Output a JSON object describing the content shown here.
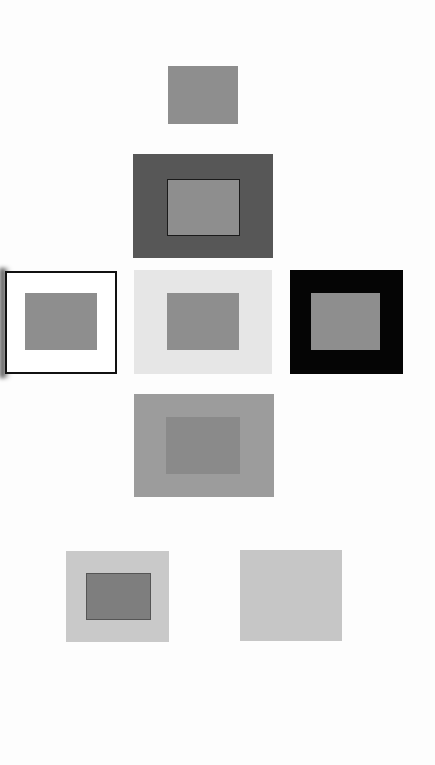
{
  "figure": {
    "colors": {
      "page_background": "#fdfdfd",
      "test_gray": "#8e8e8e",
      "dark_gray_surround": "#575757",
      "white_surround": "#ffffff",
      "light_gray_surround": "#e6e6e6",
      "black_surround": "#050505",
      "mid_gray_surround": "#9c9c9c",
      "mid_gray_inner": "#8a8a8a",
      "pale_surround": "#c9c9c9",
      "pale_inner": "#7e7e7e",
      "uniform_gray": "#c6c6c6",
      "outline": "#111111"
    },
    "panels": [
      {
        "id": "isolated",
        "label": "gray square alone",
        "x": 168,
        "y": 66,
        "w": 70,
        "h": 58
      },
      {
        "id": "on-dark-gray",
        "label": "gray square on dark gray",
        "x": 133,
        "y": 154,
        "w": 140,
        "h": 104,
        "inner": {
          "x": 167,
          "y": 179,
          "w": 73,
          "h": 57
        }
      },
      {
        "id": "on-white",
        "label": "gray square on white with black outline",
        "x": 5,
        "y": 271,
        "w": 112,
        "h": 103,
        "inner": {
          "x": 25,
          "y": 293,
          "w": 72,
          "h": 57
        }
      },
      {
        "id": "on-light-gray",
        "label": "gray square on light gray",
        "x": 134,
        "y": 270,
        "w": 138,
        "h": 104,
        "inner": {
          "x": 167,
          "y": 293,
          "w": 72,
          "h": 57
        }
      },
      {
        "id": "on-black",
        "label": "gray square on black",
        "x": 290,
        "y": 270,
        "w": 113,
        "h": 104,
        "inner": {
          "x": 311,
          "y": 293,
          "w": 69,
          "h": 57
        }
      },
      {
        "id": "on-mid-gray",
        "label": "gray square on mid gray",
        "x": 134,
        "y": 394,
        "w": 140,
        "h": 103,
        "inner": {
          "x": 166,
          "y": 417,
          "w": 74,
          "h": 57
        }
      },
      {
        "id": "on-pale-gray",
        "label": "darker square on pale gray",
        "x": 66,
        "y": 551,
        "w": 103,
        "h": 91,
        "inner": {
          "x": 86,
          "y": 573,
          "w": 65,
          "h": 47
        }
      },
      {
        "id": "uniform",
        "label": "uniform pale gray field",
        "x": 240,
        "y": 550,
        "w": 102,
        "h": 91
      }
    ]
  }
}
